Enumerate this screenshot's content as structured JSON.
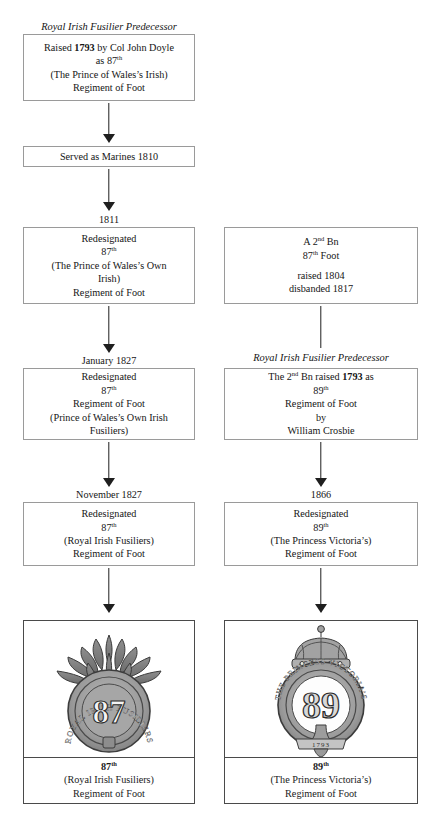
{
  "document": {
    "title": "Royal Irish Fusiliers regimental lineage chart",
    "background": "#ffffff",
    "ink": "#151515",
    "box_border": "#9a9a9a",
    "plate_border": "#4a4a4a"
  },
  "left_column": {
    "header_1793": "Royal Irish Fusilier Predecessor",
    "box_1793": {
      "line1_pre": "Raised ",
      "line1_year": "1793",
      "line1_post": " by Col John Doyle",
      "line2_pre": "as 87",
      "line2_sup": "th",
      "line3": "(The Prince of Wales’s Irish)",
      "line4": "Regiment of Foot"
    },
    "box_marines": {
      "line1": "Served as Marines 1810"
    },
    "date_1811": "1811",
    "box_1811": {
      "line1": "Redesignated",
      "line2_num": "87",
      "line2_sup": "th",
      "line3": "(The Prince of Wales’s Own",
      "line4": "Irish)",
      "line5": "Regiment of Foot"
    },
    "date_jan_1827": "January 1827",
    "box_jan_1827": {
      "line1": "Redesignated",
      "line2_num": "87",
      "line2_sup": "th",
      "line3": "Regiment of Foot",
      "line4": "(Prince of Wales’s Own Irish",
      "line5": "Fusiliers)"
    },
    "date_nov_1827": "November 1827",
    "box_nov_1827": {
      "line1": "Redesignated",
      "line2_num": "87",
      "line2_sup": "th",
      "line3": "(Royal Irish Fusiliers)",
      "line4": "Regiment of Foot"
    },
    "badge": {
      "icon": "grenade-badge-87th",
      "garter_text": "ROYAL IRISH FUSILIERS",
      "numeral": "87",
      "caption_num": "87",
      "caption_sup": "th",
      "caption_line2": "(Royal Irish Fusiliers)",
      "caption_line3": "Regiment of Foot"
    }
  },
  "right_column": {
    "box_2nd_bn_87": {
      "line1_pre": "A 2",
      "line1_sup": "nd",
      "line1_post": " Bn",
      "line2_num": "87",
      "line2_sup": "th",
      "line2_post": " Foot",
      "line3": "raised 1804",
      "line4": "disbanded 1817"
    },
    "header_1793": "Royal Irish Fusilier Predecessor",
    "box_1793": {
      "line1_pre": "The 2",
      "line1_sup": "nd",
      "line1_mid": " Bn raised ",
      "line1_year": "1793",
      "line1_post": " as",
      "line2_num": "89",
      "line2_sup": "th",
      "line3": "Regiment of Foot",
      "line4": "by",
      "line5": "William Crosbie"
    },
    "date_1866": "1866",
    "box_1866": {
      "line1": "Redesignated",
      "line2_num": "89",
      "line2_sup": "th",
      "line3": "(The Princess Victoria’s)",
      "line4": "Regiment of Foot"
    },
    "badge": {
      "icon": "crowned-garter-badge-89th",
      "garter_text": "THE PRINCESS VICTORIA’S",
      "numeral": "89",
      "scroll_text": "1793",
      "caption_num": "89",
      "caption_sup": "th",
      "caption_line2": "(The Princess Victoria’s)",
      "caption_line3": "Regiment of Foot"
    }
  }
}
